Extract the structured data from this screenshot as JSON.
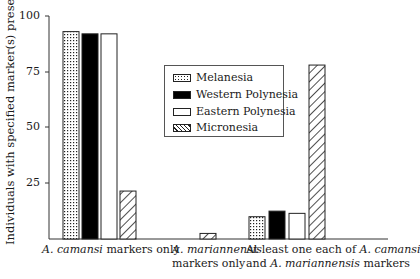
{
  "chart_data": {
    "type": "bar",
    "title": "",
    "xlabel": "",
    "ylabel": "Individuals with specified marker(s) present (%)",
    "ylim": [
      0,
      100
    ],
    "yticks": [
      25,
      50,
      75,
      100
    ],
    "grid": false,
    "legend_position": "inside upper center",
    "categories": [
      "A. camansi markers only",
      "A. mariannensis markers only",
      "At least one each of A. camansi and A. mariannensis markers"
    ],
    "series": [
      {
        "name": "Melanesia",
        "pattern": "dotted",
        "values": [
          93,
          0,
          10
        ]
      },
      {
        "name": "Western Polynesia",
        "pattern": "solid-black",
        "values": [
          92,
          0,
          12.5
        ]
      },
      {
        "name": "Eastern Polynesia",
        "pattern": "white",
        "values": [
          92,
          0,
          11.5
        ]
      },
      {
        "name": "Micronesia",
        "pattern": "diagonal-hatch",
        "values": [
          21.5,
          2.5,
          78
        ]
      }
    ]
  },
  "labels": {
    "ylabel": "Individuals with specified marker(s) present (%)",
    "ticks": [
      "100",
      "75",
      "50",
      "25"
    ],
    "cat1_italic": "A. camansi",
    "cat1_rest": " markers only",
    "cat2_line1_italic": "A. mariannensis",
    "cat2_line2": "markers only",
    "cat3_line1_a": "At least one each of ",
    "cat3_line1_italic": "A. camansi",
    "cat3_line2_a": "and ",
    "cat3_line2_italic": "A. mariannensis",
    "cat3_line2_b": " markers"
  },
  "legend": {
    "items": [
      "Melanesia",
      "Western Polynesia",
      "Eastern Polynesia",
      "Micronesia"
    ]
  }
}
